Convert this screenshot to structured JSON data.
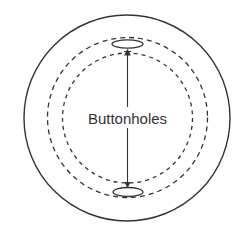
{
  "diagram": {
    "label": "Buttonholes",
    "colors": {
      "background": "#ffffff",
      "stroke": "#333333",
      "text": "#333333"
    },
    "outer_circle": {
      "cx": 127,
      "cy": 118,
      "r": 103
    },
    "dashed_circles": [
      {
        "cx": 127.5,
        "cy": 117.5,
        "r": 80
      },
      {
        "cx": 127.5,
        "cy": 118,
        "r": 65
      }
    ],
    "buttonholes": [
      {
        "cx": 127.5,
        "cy": 44,
        "rx": 15.5,
        "ry": 4.2
      },
      {
        "cx": 128,
        "cy": 192,
        "rx": 15,
        "ry": 4.5
      }
    ],
    "arrow": {
      "x": 127.5,
      "y1": 50,
      "y2": 187,
      "style": "double-headed"
    }
  }
}
